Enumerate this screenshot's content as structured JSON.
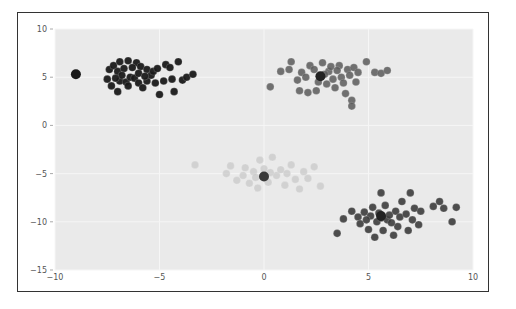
{
  "chart_data": {
    "type": "scatter",
    "title": "",
    "xlabel": "",
    "ylabel": "",
    "xlim": [
      -10,
      10
    ],
    "ylim": [
      -15,
      10
    ],
    "grid": true,
    "legend": null,
    "xticks": [
      "-10",
      "-5",
      "0",
      "5",
      "10"
    ],
    "yticks": [
      "10",
      "5",
      "0",
      "-5",
      "-10",
      "-15"
    ],
    "background": "#eaeaea",
    "series": [
      {
        "name": "cluster-1",
        "color": "#1a1a1a",
        "alpha": 0.95,
        "centroid": [
          -6.5,
          5.2
        ],
        "points": [
          [
            -9.0,
            5.3
          ],
          [
            -7.4,
            5.8
          ],
          [
            -7.2,
            6.2
          ],
          [
            -6.9,
            6.6
          ],
          [
            -6.5,
            6.7
          ],
          [
            -6.1,
            6.5
          ],
          [
            -7.0,
            5.6
          ],
          [
            -6.7,
            5.9
          ],
          [
            -6.3,
            6.0
          ],
          [
            -5.9,
            6.1
          ],
          [
            -5.6,
            5.8
          ],
          [
            -7.5,
            4.8
          ],
          [
            -7.3,
            4.1
          ],
          [
            -7.0,
            3.5
          ],
          [
            -6.9,
            4.6
          ],
          [
            -6.6,
            4.5
          ],
          [
            -6.4,
            5.0
          ],
          [
            -6.2,
            4.9
          ],
          [
            -6.0,
            4.4
          ],
          [
            -5.8,
            3.9
          ],
          [
            -5.6,
            4.6
          ],
          [
            -5.4,
            5.2
          ],
          [
            -5.2,
            4.4
          ],
          [
            -5.0,
            3.2
          ],
          [
            -4.8,
            4.6
          ],
          [
            -4.7,
            6.3
          ],
          [
            -4.5,
            6.0
          ],
          [
            -4.4,
            4.8
          ],
          [
            -4.3,
            3.5
          ],
          [
            -3.9,
            4.7
          ],
          [
            -3.7,
            5.0
          ],
          [
            -3.4,
            5.3
          ],
          [
            -4.1,
            6.6
          ],
          [
            -6.8,
            5.2
          ],
          [
            -6.0,
            5.4
          ],
          [
            -5.7,
            5.1
          ],
          [
            -5.3,
            5.6
          ],
          [
            -5.1,
            5.9
          ],
          [
            -7.1,
            4.9
          ],
          [
            -6.5,
            4.1
          ]
        ]
      },
      {
        "name": "cluster-2",
        "color": "#5a5a5a",
        "alpha": 0.85,
        "centroid": [
          2.7,
          5.1
        ],
        "points": [
          [
            0.3,
            4.0
          ],
          [
            0.8,
            5.6
          ],
          [
            1.2,
            5.8
          ],
          [
            1.3,
            6.6
          ],
          [
            1.6,
            4.7
          ],
          [
            1.7,
            3.6
          ],
          [
            1.8,
            5.5
          ],
          [
            2.0,
            5.0
          ],
          [
            2.1,
            3.4
          ],
          [
            2.2,
            6.2
          ],
          [
            2.4,
            5.8
          ],
          [
            2.5,
            3.6
          ],
          [
            2.6,
            4.5
          ],
          [
            2.8,
            6.5
          ],
          [
            3.0,
            4.3
          ],
          [
            3.1,
            5.6
          ],
          [
            3.2,
            6.1
          ],
          [
            3.3,
            4.8
          ],
          [
            3.4,
            3.9
          ],
          [
            3.6,
            6.2
          ],
          [
            3.7,
            5.0
          ],
          [
            3.8,
            4.4
          ],
          [
            3.9,
            3.3
          ],
          [
            4.0,
            5.8
          ],
          [
            4.1,
            5.2
          ],
          [
            4.2,
            2.6
          ],
          [
            4.2,
            2.0
          ],
          [
            4.3,
            6.0
          ],
          [
            4.4,
            4.5
          ],
          [
            4.5,
            5.5
          ],
          [
            2.9,
            5.3
          ],
          [
            3.5,
            5.7
          ],
          [
            4.9,
            6.6
          ],
          [
            5.3,
            5.5
          ],
          [
            5.6,
            5.4
          ],
          [
            5.9,
            5.7
          ]
        ]
      },
      {
        "name": "cluster-3",
        "color": "#c6c6c6",
        "alpha": 0.7,
        "centroid": [
          0.0,
          -5.3
        ],
        "points": [
          [
            -3.3,
            -4.1
          ],
          [
            -1.8,
            -5.0
          ],
          [
            -1.6,
            -4.2
          ],
          [
            -1.3,
            -5.7
          ],
          [
            -1.0,
            -5.2
          ],
          [
            -0.9,
            -4.4
          ],
          [
            -0.7,
            -6.0
          ],
          [
            -0.5,
            -4.8
          ],
          [
            -0.3,
            -6.5
          ],
          [
            -0.2,
            -3.6
          ],
          [
            0.0,
            -4.5
          ],
          [
            0.2,
            -5.9
          ],
          [
            0.4,
            -3.3
          ],
          [
            0.6,
            -5.2
          ],
          [
            0.8,
            -4.6
          ],
          [
            1.0,
            -6.2
          ],
          [
            1.1,
            -5.0
          ],
          [
            1.3,
            -4.1
          ],
          [
            1.5,
            -5.6
          ],
          [
            1.7,
            -6.6
          ],
          [
            1.9,
            -4.8
          ],
          [
            2.1,
            -5.5
          ],
          [
            2.4,
            -4.3
          ],
          [
            2.7,
            -6.3
          ],
          [
            -0.4,
            -5.4
          ],
          [
            0.3,
            -4.9
          ]
        ]
      },
      {
        "name": "cluster-4",
        "color": "#3c3c3c",
        "alpha": 0.9,
        "centroid": [
          5.5,
          -9.5
        ],
        "points": [
          [
            3.5,
            -11.2
          ],
          [
            3.8,
            -9.7
          ],
          [
            4.2,
            -8.9
          ],
          [
            4.5,
            -9.5
          ],
          [
            4.6,
            -10.2
          ],
          [
            4.8,
            -9.0
          ],
          [
            5.0,
            -10.8
          ],
          [
            5.1,
            -9.4
          ],
          [
            5.2,
            -8.5
          ],
          [
            5.3,
            -11.6
          ],
          [
            5.4,
            -10.0
          ],
          [
            5.5,
            -9.1
          ],
          [
            5.6,
            -7.0
          ],
          [
            5.7,
            -10.9
          ],
          [
            5.8,
            -8.3
          ],
          [
            5.9,
            -9.8
          ],
          [
            6.0,
            -9.3
          ],
          [
            6.2,
            -11.4
          ],
          [
            6.3,
            -8.9
          ],
          [
            6.4,
            -10.5
          ],
          [
            6.5,
            -9.5
          ],
          [
            6.6,
            -7.9
          ],
          [
            6.8,
            -9.2
          ],
          [
            6.9,
            -10.9
          ],
          [
            7.0,
            -7.0
          ],
          [
            7.1,
            -9.8
          ],
          [
            7.2,
            -8.6
          ],
          [
            7.4,
            -10.3
          ],
          [
            7.5,
            -8.9
          ],
          [
            8.1,
            -8.4
          ],
          [
            8.4,
            -7.9
          ],
          [
            8.6,
            -8.6
          ],
          [
            9.0,
            -10.0
          ],
          [
            9.2,
            -8.5
          ],
          [
            4.9,
            -9.8
          ],
          [
            5.6,
            -9.6
          ],
          [
            6.1,
            -10.1
          ]
        ]
      }
    ],
    "centroids": [
      {
        "x": -9.0,
        "y": 5.3,
        "color": "#1a1a1a"
      },
      {
        "x": 2.7,
        "y": 5.1,
        "color": "#222222"
      },
      {
        "x": 0.0,
        "y": -5.3,
        "color": "#3a3a3a"
      },
      {
        "x": 5.6,
        "y": -9.4,
        "color": "#222222"
      }
    ]
  }
}
